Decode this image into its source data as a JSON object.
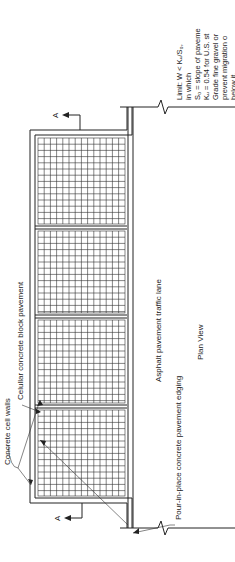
{
  "diagram": {
    "view_title": "Plan View",
    "orientation": "rotated 90 degrees counter-clockwise",
    "labels": {
      "cell_walls": "Concrete cell walls",
      "block_pavement": "Celullar concrete block pavement",
      "traffic_lane": "Asphalt pavement traffic lane",
      "edging": "Pour-in-place concrete pavement edging",
      "section_marker": "A"
    },
    "notes": {
      "limit": "Limit:  W < Kᵤ/S₀,",
      "in_which": "in which",
      "line1": "S₀ = slope of paveme",
      "line2": "Kᵤ = 0.54 for U.S. st",
      "line3": "Grade fine gravel or",
      "line4": "prevent migration o",
      "line5": "below it."
    },
    "grid": {
      "blocks": 4,
      "colors": {
        "line": "#222222",
        "background": "#ffffff"
      }
    }
  }
}
